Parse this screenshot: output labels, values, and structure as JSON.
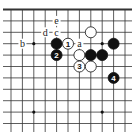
{
  "diagram": {
    "type": "go-board-fragment",
    "edge": "top",
    "columns": 11,
    "rows": 11,
    "colors": {
      "black": "#111111",
      "white": "#ffffff",
      "line": "#333333"
    },
    "star_points": [
      [
        2,
        3
      ],
      [
        8,
        3
      ],
      [
        2,
        9
      ],
      [
        8,
        9
      ]
    ],
    "stones": [
      {
        "color": "white",
        "col": 7,
        "row": 2,
        "label": ""
      },
      {
        "color": "black",
        "col": 4,
        "row": 3,
        "label": ""
      },
      {
        "color": "white",
        "col": 5,
        "row": 3,
        "label": "1"
      },
      {
        "color": "black",
        "col": 9,
        "row": 3,
        "label": ""
      },
      {
        "color": "black",
        "col": 4,
        "row": 4,
        "label": "2"
      },
      {
        "color": "white",
        "col": 6,
        "row": 4,
        "label": ""
      },
      {
        "color": "black",
        "col": 7,
        "row": 4,
        "label": ""
      },
      {
        "color": "black",
        "col": 8,
        "row": 4,
        "label": ""
      },
      {
        "color": "white",
        "col": 6,
        "row": 5,
        "label": "3"
      },
      {
        "color": "white",
        "col": 7,
        "row": 5,
        "label": ""
      },
      {
        "color": "black",
        "col": 9,
        "row": 6,
        "label": "4"
      }
    ],
    "letters": [
      {
        "text": "e",
        "col": 4,
        "row": 1
      },
      {
        "text": "d",
        "col": 3,
        "row": 2
      },
      {
        "text": "c",
        "col": 4,
        "row": 2
      },
      {
        "text": "b",
        "col": 1,
        "row": 3
      },
      {
        "text": "a",
        "col": 6,
        "row": 3
      }
    ]
  }
}
